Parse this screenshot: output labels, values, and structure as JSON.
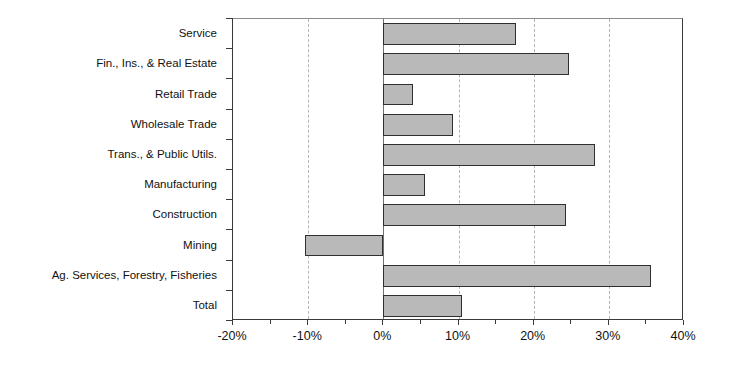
{
  "chart_data": {
    "type": "bar",
    "orientation": "horizontal",
    "title": "",
    "subtitle": "",
    "xlabel": "",
    "ylabel": "",
    "categories": [
      "Service",
      "Fin., Ins., & Real Estate",
      "Retail Trade",
      "Wholesale Trade",
      "Trans., & Public Utils.",
      "Manufacturing",
      "Construction",
      "Mining",
      "Ag. Services, Forestry, Fisheries",
      "Total"
    ],
    "values": [
      17.6,
      24.7,
      4.0,
      9.3,
      28.1,
      5.6,
      24.3,
      -10.4,
      35.6,
      10.4
    ],
    "value_unit": "percent",
    "xlim": [
      -20,
      40
    ],
    "xticks": [
      -20,
      -10,
      0,
      10,
      20,
      30,
      40
    ],
    "xtick_labels": [
      "-20%",
      "-10%",
      "0%",
      "10%",
      "20%",
      "30%",
      "40%"
    ],
    "xticks_minor": [
      -15,
      -5,
      5,
      15,
      25,
      35
    ],
    "gridlines": {
      "vertical": true,
      "horizontal": false,
      "style": "dashed"
    },
    "legend": {
      "show": false,
      "entries": []
    },
    "colors": {
      "bar_fill": "#b9b9b9",
      "bar_border": "#2f2f2f",
      "axis": "#3a3a3a",
      "gridline": "#b5b5b5",
      "zero_line": "#6f6f6f",
      "text": "#111111",
      "background": "#ffffff"
    }
  }
}
